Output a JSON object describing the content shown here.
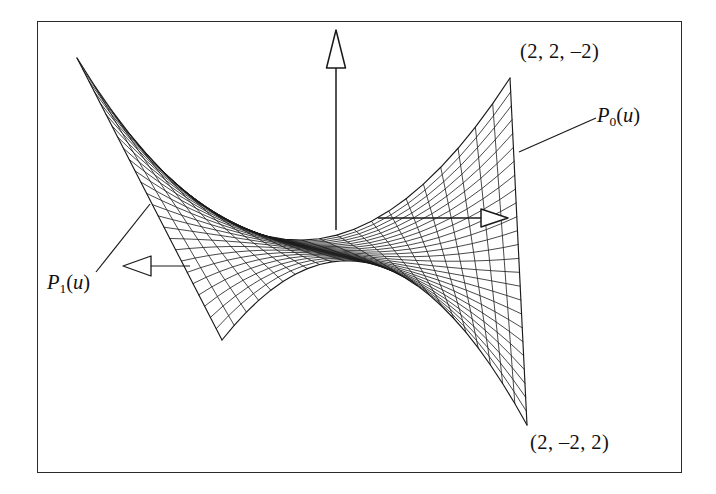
{
  "figure": {
    "type": "ruled-surface-wireframe",
    "frame": {
      "stroke": "#2a2a2a"
    },
    "wire_color": "#1a1a1a",
    "background": "#ffffff"
  },
  "labels": {
    "corner_top_right": "(2, 2, –2)",
    "corner_bottom_right": "(2, –2, 2)",
    "curve_p0_name": "P",
    "curve_p0_sub": "0",
    "curve_p0_arg": "(u)",
    "curve_p1_name": "P",
    "curve_p1_sub": "1",
    "curve_p1_arg": "(u)"
  },
  "axes": {
    "vertical": {
      "name": "y-axis",
      "arrow": "up",
      "x": 336,
      "y_top": 38,
      "y_bottom": 228
    },
    "horizontal": {
      "name": "x-axis",
      "arrow": "right",
      "y": 218,
      "x_left": 380,
      "x_right": 494
    }
  },
  "chart_data": {
    "type": "line",
    "title": "",
    "xlabel": "",
    "ylabel": "",
    "surface": {
      "kind": "bilinear-ruled-patch",
      "corner_points_3d": [
        {
          "name": "P0(0)",
          "value": [
            2,
            2,
            -2
          ]
        },
        {
          "name": "P0(1)",
          "value": [
            2,
            -2,
            2
          ]
        },
        {
          "name": "P1(0)",
          "value": [
            -2,
            2,
            2
          ]
        },
        {
          "name": "P1(1)",
          "value": [
            -2,
            -2,
            -2
          ]
        }
      ],
      "screen_corners": [
        {
          "name": "top-left",
          "x": 77,
          "y": 58
        },
        {
          "name": "top-right",
          "x": 510,
          "y": 78
        },
        {
          "name": "bottom-left",
          "x": 222,
          "y": 340
        },
        {
          "name": "bottom-right",
          "x": 527,
          "y": 425
        }
      ],
      "ruling_count_u": 25,
      "ruling_count_v": 25
    },
    "annotations": [
      {
        "text": "(2, 2, –2)",
        "x": 520,
        "y": 41
      },
      {
        "text": "(2, –2, 2)",
        "x": 530,
        "y": 432
      },
      {
        "text": "P0(u)",
        "x": 597,
        "y": 105
      },
      {
        "text": "P1(u)",
        "x": 47,
        "y": 272
      }
    ],
    "grid": false,
    "legend": "none"
  }
}
